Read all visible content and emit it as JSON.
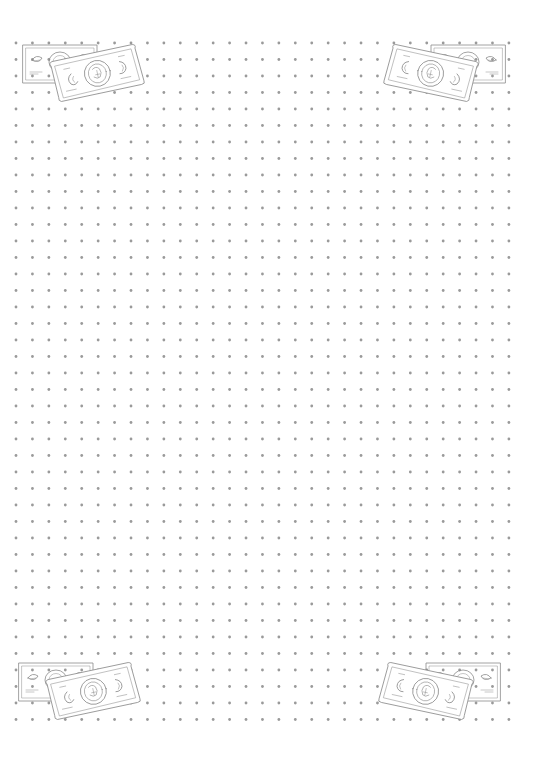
{
  "page": {
    "type": "dot-grid-paper",
    "background_color": "#ffffff",
    "width": 534,
    "height": 776
  },
  "grid": {
    "columns": 31,
    "rows": 42,
    "origin_x": 16,
    "origin_y": 43,
    "spacing_x": 16.43,
    "spacing_y": 16.5,
    "dot_radius": 1.4,
    "dot_color": "#9a9a9a"
  },
  "decorations": {
    "line_color": "#8c8c8c",
    "corners": [
      {
        "name": "top-left",
        "x": 18,
        "y": 40,
        "mirror": false,
        "icon": "money-bills-icon"
      },
      {
        "name": "top-right",
        "x": 385,
        "y": 40,
        "mirror": true,
        "icon": "money-bills-icon"
      },
      {
        "name": "bottom-left",
        "x": 14,
        "y": 658,
        "mirror": false,
        "icon": "money-bills-icon"
      },
      {
        "name": "bottom-right",
        "x": 380,
        "y": 658,
        "mirror": true,
        "icon": "money-bills-icon"
      }
    ]
  }
}
